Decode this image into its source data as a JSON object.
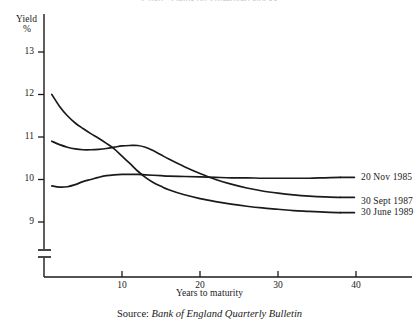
{
  "figure": {
    "title_clipped": "Chart: Yields on gilt-edged stocks",
    "source_prefix": "Source:",
    "source_body": "Bank of England Quarterly Bulletin"
  },
  "axes": {
    "y_title_line1": "Yield",
    "y_title_line2": "%",
    "x_title": "Years to maturity",
    "y_ticks": [
      "13",
      "12",
      "11",
      "10",
      "9"
    ],
    "x_ticks": [
      "10",
      "20",
      "30",
      "40"
    ]
  },
  "chart_data": {
    "type": "line",
    "title": "Yields on gilt-edged stocks",
    "xlabel": "Years to maturity",
    "ylabel": "Yield %",
    "xlim": [
      0,
      47
    ],
    "ylim": [
      8.6,
      13.4
    ],
    "y_ticks": [
      9,
      10,
      11,
      12,
      13
    ],
    "x_ticks": [
      10,
      20,
      30,
      40
    ],
    "grid": false,
    "y_axis_break": true,
    "y_axis_break_below": 9,
    "legend_position": "inline-right",
    "series": [
      {
        "name": "20 Nov 1985",
        "label": "20 Nov 1985",
        "color": "#1a1a1a",
        "x": [
          1,
          2,
          3,
          4,
          5,
          6,
          7,
          8,
          9,
          10,
          11,
          12,
          13,
          14,
          15,
          16,
          18,
          20,
          22,
          24,
          26,
          28,
          30,
          32,
          34,
          36,
          38
        ],
        "y": [
          9.85,
          9.82,
          9.83,
          9.88,
          9.95,
          10.0,
          10.05,
          10.09,
          10.11,
          10.12,
          10.12,
          10.12,
          10.11,
          10.1,
          10.09,
          10.08,
          10.07,
          10.06,
          10.05,
          10.04,
          10.04,
          10.03,
          10.03,
          10.03,
          10.03,
          10.04,
          10.05
        ]
      },
      {
        "name": "30 Sept 1987",
        "label": "30 Sept 1987",
        "color": "#1a1a1a",
        "x": [
          1,
          2,
          3,
          4,
          5,
          6,
          7,
          8,
          9,
          10,
          11,
          12,
          13,
          14,
          15,
          16,
          18,
          20,
          22,
          24,
          26,
          28,
          30,
          32,
          34,
          36,
          38
        ],
        "y": [
          10.9,
          10.82,
          10.76,
          10.72,
          10.7,
          10.7,
          10.71,
          10.73,
          10.76,
          10.79,
          10.8,
          10.8,
          10.76,
          10.68,
          10.58,
          10.48,
          10.3,
          10.14,
          10.0,
          9.89,
          9.8,
          9.73,
          9.68,
          9.64,
          9.61,
          9.59,
          9.58
        ]
      },
      {
        "name": "30 June 1989",
        "label": "30 June 1989",
        "color": "#1a1a1a",
        "x": [
          1,
          2,
          3,
          4,
          5,
          6,
          7,
          8,
          9,
          10,
          11,
          12,
          13,
          14,
          15,
          16,
          18,
          20,
          22,
          24,
          26,
          28,
          30,
          32,
          34,
          36,
          38
        ],
        "y": [
          12.0,
          11.72,
          11.5,
          11.33,
          11.2,
          11.08,
          10.97,
          10.85,
          10.72,
          10.55,
          10.38,
          10.2,
          10.05,
          9.93,
          9.84,
          9.76,
          9.64,
          9.55,
          9.48,
          9.42,
          9.37,
          9.33,
          9.3,
          9.27,
          9.25,
          9.23,
          9.22
        ]
      }
    ]
  }
}
